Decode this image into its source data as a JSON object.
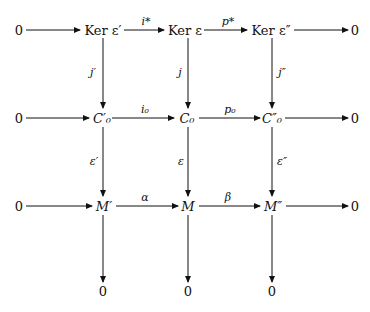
{
  "diagram": {
    "type": "commutative-diagram",
    "nodes": {
      "r0_left": "0",
      "r0_c1": "Ker ε′",
      "r0_c2": "Ker ε",
      "r0_c3": "Ker ε″",
      "r0_right": "0",
      "r1_left": "0",
      "r1_c1": "C′₀",
      "r1_c2": "C₀",
      "r1_c3": "C″₀",
      "r1_right": "0",
      "r2_left": "0",
      "r2_c1": "M′",
      "r2_c2": "M",
      "r2_c3": "M″",
      "r2_right": "0",
      "r3_c1": "0",
      "r3_c2": "0",
      "r3_c3": "0"
    },
    "horizontal_labels": {
      "r0_c1_c2": "i*",
      "r0_c2_c3": "p*",
      "r1_c1_c2": "i₀",
      "r1_c2_c3": "p₀",
      "r2_c1_c2": "α",
      "r2_c2_c3": "β"
    },
    "vertical_labels": {
      "c1_r0_r1": "j′",
      "c2_r0_r1": "j",
      "c3_r0_r1": "j″",
      "c1_r1_r2": "ε′",
      "c2_r1_r2": "ε",
      "c3_r1_r2": "ε″"
    }
  }
}
